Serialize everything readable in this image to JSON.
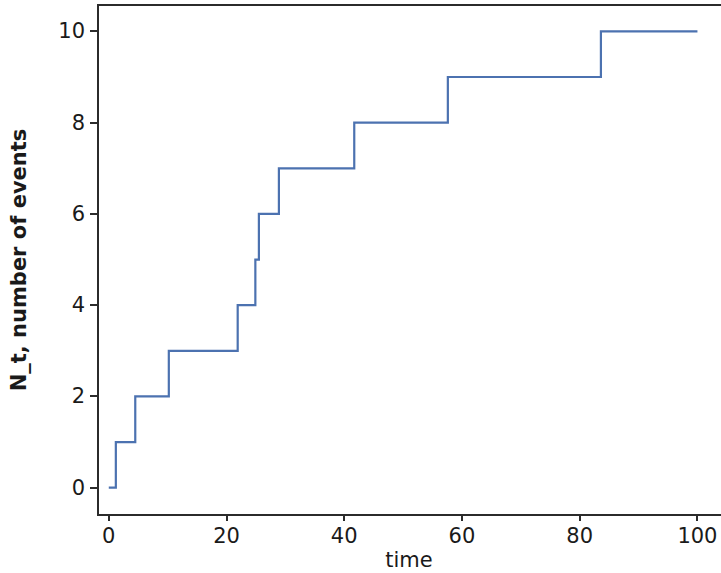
{
  "chart_data": {
    "type": "line",
    "subtype": "step-post",
    "title": "",
    "xlabel": "time",
    "ylabel": "N_t, number of events",
    "xlim": [
      -2.0,
      104.0
    ],
    "ylim": [
      -0.62,
      10.6
    ],
    "xticks": [
      0,
      20,
      40,
      60,
      80,
      100
    ],
    "yticks": [
      0,
      2,
      4,
      6,
      8,
      10
    ],
    "xticklabels": [
      "0",
      "20",
      "40",
      "60",
      "80",
      "100"
    ],
    "yticklabels": [
      "0",
      "2",
      "4",
      "6",
      "8",
      "10"
    ],
    "grid": false,
    "legend": null,
    "line_color": "#4c72b0",
    "line_width": 2.2,
    "series": [
      {
        "name": "N_t",
        "x": [
          0.0,
          1.2,
          4.5,
          10.2,
          21.9,
          24.9,
          25.5,
          28.9,
          41.7,
          57.6,
          83.6,
          100.0
        ],
        "y": [
          0,
          1,
          2,
          3,
          4,
          5,
          6,
          7,
          8,
          9,
          10,
          10
        ]
      }
    ],
    "event_times": [
      1.2,
      4.5,
      10.2,
      21.9,
      24.9,
      25.5,
      28.9,
      41.7,
      57.6,
      83.6
    ],
    "event_counts": [
      1,
      2,
      3,
      4,
      5,
      6,
      7,
      8,
      9,
      10
    ],
    "total_events": 10,
    "observation_end": 100
  },
  "figure": {
    "background": "#ffffff",
    "axis_color": "#2b2b2b"
  }
}
